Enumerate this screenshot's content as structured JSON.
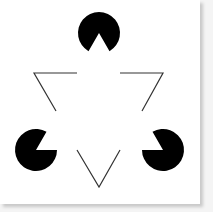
{
  "figure": {
    "background_color": "#ffffff",
    "ink_color": "#000000",
    "line_color": "#333333",
    "pacmen": [
      {
        "name": "top",
        "cx": 99,
        "cy": 33,
        "r": 21,
        "mouth_toward": "down"
      },
      {
        "name": "left",
        "cx": 36,
        "cy": 150,
        "r": 21,
        "mouth_toward": "upper-right"
      },
      {
        "name": "right",
        "cx": 163,
        "cy": 150,
        "r": 21,
        "mouth_toward": "upper-left"
      }
    ],
    "outline_segments": [
      {
        "name": "left-corner",
        "points": "77,73 34,73 56,111"
      },
      {
        "name": "right-corner",
        "points": "120,73 163,73 142,111"
      },
      {
        "name": "bottom-corner",
        "points": "77,150 99,187 120,150"
      }
    ]
  }
}
